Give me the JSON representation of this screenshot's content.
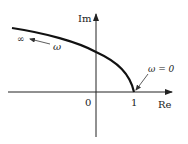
{
  "diagram": {
    "type": "nyquist-plot",
    "axes": {
      "real_label": "Re",
      "imag_label": "Im",
      "origin_label": "0",
      "tick_one_label": "1"
    },
    "annotations": {
      "start_label": "ω = 0",
      "infinity_label": "∞",
      "direction_label": "ω"
    },
    "colors": {
      "curve": "#111111",
      "axis": "#222222",
      "background": "#ffffff"
    }
  }
}
